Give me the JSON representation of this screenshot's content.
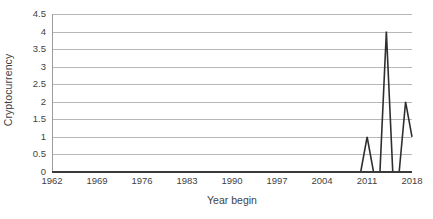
{
  "chart_data": {
    "type": "line",
    "title": "",
    "xlabel": "Year begin",
    "ylabel": "Cryptocurrency",
    "xlim": [
      1962,
      2018
    ],
    "ylim": [
      0,
      4.5
    ],
    "grid": true,
    "legend": false,
    "legend_position": "none",
    "line_color": "#2f2f2f",
    "gridline_color": "#b7b7b7",
    "axis_color": "#9c9c9c",
    "background_color": "#ffffff",
    "y_ticks": [
      "0",
      "0.5",
      "1",
      "1.5",
      "2",
      "2.5",
      "3",
      "3.5",
      "4",
      "4.5"
    ],
    "y_tick_values": [
      0,
      0.5,
      1,
      1.5,
      2,
      2.5,
      3,
      3.5,
      4,
      4.5
    ],
    "x_ticks": [
      "1962",
      "1969",
      "1976",
      "1983",
      "1990",
      "1997",
      "2004",
      "2011",
      "2018"
    ],
    "x_tick_values": [
      1962,
      1969,
      1976,
      1983,
      1990,
      1997,
      2004,
      2011,
      2018
    ],
    "x": [
      1962,
      1963,
      1964,
      1965,
      1966,
      1967,
      1968,
      1969,
      1970,
      1971,
      1972,
      1973,
      1974,
      1975,
      1976,
      1977,
      1978,
      1979,
      1980,
      1981,
      1982,
      1983,
      1984,
      1985,
      1986,
      1987,
      1988,
      1989,
      1990,
      1991,
      1992,
      1993,
      1994,
      1995,
      1996,
      1997,
      1998,
      1999,
      2000,
      2001,
      2002,
      2003,
      2004,
      2005,
      2006,
      2007,
      2008,
      2009,
      2010,
      2011,
      2012,
      2013,
      2014,
      2015,
      2016,
      2017,
      2018
    ],
    "values": [
      0,
      0,
      0,
      0,
      0,
      0,
      0,
      0,
      0,
      0,
      0,
      0,
      0,
      0,
      0,
      0,
      0,
      0,
      0,
      0,
      0,
      0,
      0,
      0,
      0,
      0,
      0,
      0,
      0,
      0,
      0,
      0,
      0,
      0,
      0,
      0,
      0,
      0,
      0,
      0,
      0,
      0,
      0,
      0,
      0,
      0,
      0,
      0,
      0,
      1,
      0,
      0,
      4,
      0,
      0,
      2,
      1
    ],
    "series": [
      {
        "name": "Cryptocurrency",
        "values": [
          0,
          0,
          0,
          0,
          0,
          0,
          0,
          0,
          0,
          0,
          0,
          0,
          0,
          0,
          0,
          0,
          0,
          0,
          0,
          0,
          0,
          0,
          0,
          0,
          0,
          0,
          0,
          0,
          0,
          0,
          0,
          0,
          0,
          0,
          0,
          0,
          0,
          0,
          0,
          0,
          0,
          0,
          0,
          0,
          0,
          0,
          0,
          0,
          0,
          1,
          0,
          0,
          4,
          0,
          0,
          2,
          1
        ]
      }
    ],
    "annotations": []
  }
}
